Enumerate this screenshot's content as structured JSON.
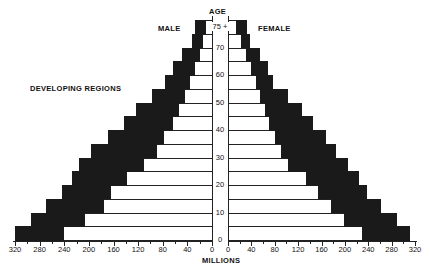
{
  "labels": {
    "age": "AGE",
    "male": "MALE",
    "female": "FEMALE",
    "region": "DEVELOPING REGIONS",
    "xaxis": "MILLIONS"
  },
  "chart_data": {
    "type": "bar",
    "title": "DEVELOPING REGIONS",
    "subtype": "population pyramid (stacked horizontal bars, white inner = earlier year, black outer = projected increase)",
    "xlabel": "MILLIONS",
    "ylabel": "AGE",
    "xlim_male": [
      320,
      0
    ],
    "xlim_female": [
      0,
      320
    ],
    "x_ticks": [
      0,
      40,
      80,
      120,
      160,
      200,
      240,
      280,
      320
    ],
    "age_ticks": [
      "0",
      "10",
      "20",
      "30",
      "40",
      "50",
      "60",
      "70",
      "75 +"
    ],
    "categories": [
      "0-4",
      "5-9",
      "10-14",
      "15-19",
      "20-24",
      "25-29",
      "30-34",
      "35-39",
      "40-44",
      "45-49",
      "50-54",
      "55-59",
      "60-64",
      "65-69",
      "70-74",
      "75+"
    ],
    "legend": [
      "MALE",
      "FEMALE"
    ],
    "series": [
      {
        "name": "Male (inner, white)",
        "values": [
          240,
          206,
          176,
          164,
          138,
          110,
          90,
          78,
          64,
          54,
          44,
          35,
          27,
          20,
          14,
          10
        ]
      },
      {
        "name": "Male (total, outer)",
        "values": [
          320,
          294,
          269,
          244,
          227,
          216,
          196,
          169,
          143,
          123,
          97,
          76,
          63,
          49,
          32,
          28
        ]
      },
      {
        "name": "Female (inner, white)",
        "values": [
          230,
          198,
          176,
          154,
          134,
          102,
          90,
          80,
          70,
          63,
          55,
          48,
          40,
          30,
          22,
          14
        ]
      },
      {
        "name": "Female (total, outer)",
        "values": [
          312,
          290,
          262,
          238,
          224,
          206,
          184,
          167,
          145,
          127,
          103,
          77,
          68,
          55,
          37,
          32
        ]
      }
    ]
  }
}
